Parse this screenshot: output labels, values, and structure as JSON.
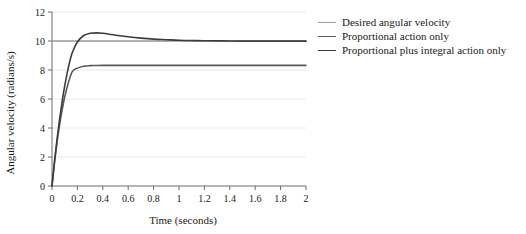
{
  "chart_data": {
    "type": "line",
    "title": "",
    "xlabel": "Time (seconds)",
    "ylabel": "Angular velocity (radians/s)",
    "xlim": [
      0,
      2
    ],
    "ylim": [
      0,
      12
    ],
    "xticks": [
      "0",
      "0.2",
      "0.4",
      "0.6",
      "0.8",
      "1",
      "1.2",
      "1.4",
      "1.6",
      "1.8",
      "2"
    ],
    "xtick_values": [
      0,
      0.2,
      0.4,
      0.6,
      0.8,
      1,
      1.2,
      1.4,
      1.6,
      1.8,
      2
    ],
    "yticks": [
      "0",
      "2",
      "4",
      "6",
      "8",
      "10",
      "12"
    ],
    "ytick_values": [
      0,
      2,
      4,
      6,
      8,
      10,
      12
    ],
    "grid": true,
    "grid_axis": "y",
    "grid_color": "#e8e8e8",
    "legend_position": "right-outside",
    "series": [
      {
        "name": "Desired angular velocity",
        "color": "#9a9a9a",
        "width": 1.6,
        "x": [
          0,
          0.05,
          0.2,
          0.5,
          1.0,
          1.5,
          2.0
        ],
        "values": [
          10,
          10,
          10,
          10,
          10,
          10,
          10
        ]
      },
      {
        "name": "Proportional action only",
        "color": "#595959",
        "width": 1.6,
        "x": [
          0,
          0.02,
          0.04,
          0.06,
          0.08,
          0.1,
          0.13,
          0.16,
          0.2,
          0.25,
          0.3,
          0.35,
          0.4,
          0.5,
          0.6,
          0.8,
          1.0,
          1.25,
          1.5,
          1.75,
          2.0
        ],
        "values": [
          0,
          1.63,
          3.03,
          4.23,
          5.26,
          6.14,
          7.16,
          7.89,
          8.13,
          8.26,
          8.3,
          8.31,
          8.32,
          8.32,
          8.32,
          8.32,
          8.32,
          8.32,
          8.32,
          8.32,
          8.32
        ]
      },
      {
        "name": "Proportional plus integral action only",
        "color": "#3c3c3c",
        "width": 1.6,
        "x": [
          0,
          0.02,
          0.04,
          0.06,
          0.08,
          0.1,
          0.13,
          0.16,
          0.2,
          0.25,
          0.3,
          0.35,
          0.4,
          0.45,
          0.5,
          0.6,
          0.7,
          0.8,
          0.9,
          1.0,
          1.1,
          1.2,
          1.4,
          1.6,
          1.8,
          2.0
        ],
        "values": [
          0,
          1.72,
          3.25,
          4.62,
          5.83,
          6.9,
          8.22,
          9.2,
          9.93,
          10.38,
          10.53,
          10.56,
          10.53,
          10.47,
          10.4,
          10.29,
          10.2,
          10.13,
          10.09,
          10.05,
          10.03,
          10.02,
          10.0,
          9.99,
          9.99,
          9.99
        ]
      }
    ]
  },
  "legend": {
    "items": [
      {
        "label": "Desired angular velocity",
        "color": "#9a9a9a"
      },
      {
        "label": "Proportional action only",
        "color": "#595959"
      },
      {
        "label": "Proportional plus integral action only",
        "color": "#3c3c3c"
      }
    ]
  },
  "axes": {
    "x_title": "Time (seconds)",
    "y_title": "Angular velocity (radians/s)",
    "axis_color": "#6b6b6b"
  }
}
